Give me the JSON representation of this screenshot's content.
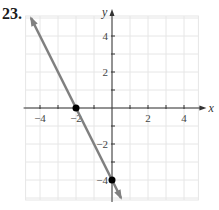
{
  "problem": {
    "number": "23."
  },
  "chart_data": {
    "type": "line",
    "title": "",
    "xlabel": "x",
    "ylabel": "y",
    "xlim": [
      -4.8,
      4.8
    ],
    "ylim": [
      -5,
      5
    ],
    "grid": true,
    "x_ticks": [
      -4,
      -3,
      -2,
      -1,
      1,
      2,
      3,
      4
    ],
    "y_ticks": [
      -4,
      -3,
      -2,
      -1,
      1,
      2,
      3,
      4
    ],
    "x_tick_labels": [
      {
        "value": -4,
        "label": "−4"
      },
      {
        "value": -2,
        "label": "−2"
      },
      {
        "value": 2,
        "label": "2"
      },
      {
        "value": 4,
        "label": "4"
      }
    ],
    "y_tick_labels": [
      {
        "value": 4,
        "label": "4"
      },
      {
        "value": 2,
        "label": "2"
      },
      {
        "value": -2,
        "label": "−2"
      },
      {
        "value": -4,
        "label": "−4"
      }
    ],
    "series": [
      {
        "name": "line",
        "equation": "y = -2x - 4",
        "x": [
          -4.5,
          0.5
        ],
        "y": [
          5,
          -5
        ],
        "color": "#808080",
        "arrows": "both"
      }
    ],
    "points": [
      {
        "x": -2,
        "y": 0,
        "label": "x-intercept"
      },
      {
        "x": 0,
        "y": -4,
        "label": "y-intercept"
      }
    ],
    "colors": {
      "grid": "#e6e6e6",
      "axis": "#333333",
      "line": "#808080",
      "point": "#000000"
    }
  }
}
